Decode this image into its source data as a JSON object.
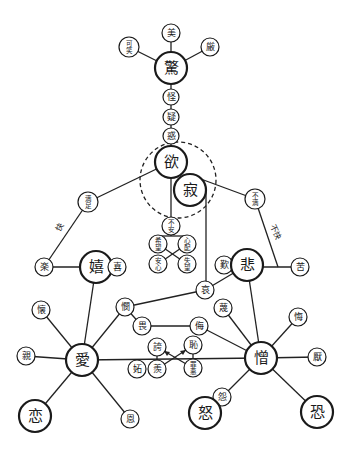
{
  "diagram": {
    "title": "",
    "colors": {
      "line": "#222222",
      "background": "#ffffff"
    },
    "nodes": [
      {
        "id": "kyo",
        "label": "驚",
        "x": 171,
        "y": 68,
        "r": 16,
        "major": true
      },
      {
        "id": "bi",
        "label": "美",
        "x": 171,
        "y": 33,
        "r": 9
      },
      {
        "id": "kawa",
        "label": "可笑",
        "x": 129,
        "y": 47,
        "r": 10
      },
      {
        "id": "gen",
        "label": "厳",
        "x": 210,
        "y": 47,
        "r": 9
      },
      {
        "id": "kai",
        "label": "怪",
        "x": 171,
        "y": 97,
        "r": 8
      },
      {
        "id": "gi",
        "label": "疑",
        "x": 171,
        "y": 117,
        "r": 8
      },
      {
        "id": "waku",
        "label": "惑",
        "x": 171,
        "y": 136,
        "r": 8
      },
      {
        "id": "yoku",
        "label": "欲",
        "x": 171,
        "y": 162,
        "r": 16,
        "major": true
      },
      {
        "id": "seki",
        "label": "寂",
        "x": 190,
        "y": 190,
        "r": 16,
        "major": true
      },
      {
        "id": "manzoku",
        "label": "満足",
        "x": 88,
        "y": 202,
        "r": 10
      },
      {
        "id": "fuman",
        "label": "不満",
        "x": 255,
        "y": 199,
        "r": 10
      },
      {
        "id": "fuan",
        "label": "不安",
        "x": 171,
        "y": 226,
        "r": 9
      },
      {
        "id": "kibo",
        "label": "希望",
        "x": 158,
        "y": 244,
        "r": 9
      },
      {
        "id": "shinpai",
        "label": "心配",
        "x": 187,
        "y": 244,
        "r": 9
      },
      {
        "id": "anshin",
        "label": "安心",
        "x": 158,
        "y": 264,
        "r": 9
      },
      {
        "id": "shitsubo",
        "label": "失望",
        "x": 187,
        "y": 264,
        "r": 9
      },
      {
        "id": "raku",
        "label": "楽",
        "x": 44,
        "y": 267,
        "r": 9
      },
      {
        "id": "ki_joy",
        "label": "嬉",
        "x": 96,
        "y": 267,
        "r": 16,
        "major": true
      },
      {
        "id": "ki",
        "label": "喜",
        "x": 117,
        "y": 267,
        "r": 9
      },
      {
        "id": "tan",
        "label": "歎",
        "x": 224,
        "y": 265,
        "r": 9
      },
      {
        "id": "hi",
        "label": "悲",
        "x": 247,
        "y": 265,
        "r": 16,
        "major": true
      },
      {
        "id": "ku",
        "label": "苦",
        "x": 300,
        "y": 267,
        "r": 9
      },
      {
        "id": "ai_sad",
        "label": "哀",
        "x": 205,
        "y": 290,
        "r": 9
      },
      {
        "id": "ken",
        "label": "憫",
        "x": 125,
        "y": 307,
        "r": 9
      },
      {
        "id": "shi",
        "label": "畏",
        "x": 142,
        "y": 326,
        "r": 9
      },
      {
        "id": "mei",
        "label": "侮",
        "x": 199,
        "y": 326,
        "r": 9
      },
      {
        "id": "ben",
        "label": "蔑",
        "x": 223,
        "y": 308,
        "r": 9
      },
      {
        "id": "kyo_proud",
        "label": "誇",
        "x": 157,
        "y": 347,
        "r": 9
      },
      {
        "id": "chi",
        "label": "恥",
        "x": 193,
        "y": 345,
        "r": 9
      },
      {
        "id": "to",
        "label": "妬",
        "x": 137,
        "y": 369,
        "r": 9
      },
      {
        "id": "ryo",
        "label": "羨",
        "x": 157,
        "y": 369,
        "r": 9
      },
      {
        "id": "zaiaku",
        "label": "罪悪",
        "x": 193,
        "y": 368,
        "r": 9
      },
      {
        "id": "kai_nat",
        "label": "懐",
        "x": 41,
        "y": 310,
        "r": 9
      },
      {
        "id": "shin",
        "label": "親",
        "x": 26,
        "y": 356,
        "r": 9
      },
      {
        "id": "ai_love",
        "label": "愛",
        "x": 82,
        "y": 360,
        "r": 16,
        "major": true
      },
      {
        "id": "koi",
        "label": "恋",
        "x": 35,
        "y": 416,
        "r": 16,
        "major": true
      },
      {
        "id": "on",
        "label": "恩",
        "x": 130,
        "y": 419,
        "r": 9
      },
      {
        "id": "kui",
        "label": "悔",
        "x": 298,
        "y": 317,
        "r": 9
      },
      {
        "id": "zo",
        "label": "憎",
        "x": 261,
        "y": 358,
        "r": 16,
        "major": true
      },
      {
        "id": "en",
        "label": "厭",
        "x": 317,
        "y": 357,
        "r": 9
      },
      {
        "id": "en_grudge",
        "label": "怨",
        "x": 222,
        "y": 397,
        "r": 9
      },
      {
        "id": "do",
        "label": "怒",
        "x": 205,
        "y": 413,
        "r": 16,
        "major": true
      },
      {
        "id": "kyofu",
        "label": "恐",
        "x": 317,
        "y": 412,
        "r": 16,
        "major": true
      }
    ],
    "edge_labels": [
      {
        "text": "快",
        "x": 60,
        "y": 232,
        "rotate": -60
      },
      {
        "text": "不快",
        "x": 270,
        "y": 226,
        "rotate": 65
      }
    ]
  }
}
